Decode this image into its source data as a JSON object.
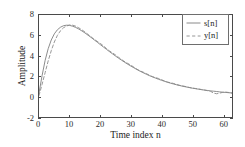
{
  "chart_data": {
    "type": "line",
    "title": "",
    "xlabel": "Time index n",
    "ylabel": "Amplitude",
    "xlim": [
      0,
      63
    ],
    "ylim": [
      -2,
      8
    ],
    "xticks": [
      0,
      10,
      20,
      30,
      40,
      50,
      60
    ],
    "yticks": [
      -2,
      0,
      2,
      4,
      6,
      8
    ],
    "xtick_labels": [
      "0",
      "10",
      "20",
      "30",
      "40",
      "50",
      "60"
    ],
    "ytick_labels": [
      "-2",
      "0",
      "2",
      "4",
      "6",
      "8"
    ],
    "grid": false,
    "legend_position": "upper right",
    "legend_entries": [
      "s[n]",
      "y[n]"
    ],
    "x": [
      0,
      1,
      2,
      3,
      4,
      5,
      6,
      7,
      8,
      9,
      10,
      11,
      12,
      13,
      14,
      15,
      16,
      17,
      18,
      19,
      20,
      21,
      22,
      23,
      24,
      25,
      26,
      27,
      28,
      29,
      30,
      31,
      32,
      33,
      34,
      35,
      36,
      37,
      38,
      39,
      40,
      41,
      42,
      43,
      44,
      45,
      46,
      47,
      48,
      49,
      50,
      51,
      52,
      53,
      54,
      55,
      56,
      57,
      58,
      59,
      60,
      61,
      62,
      63
    ],
    "series": [
      {
        "name": "s[n]",
        "style": "solid",
        "color": "#7d7d7d",
        "values": [
          0.35,
          2.05,
          3.55,
          4.7,
          5.55,
          6.15,
          6.55,
          6.8,
          6.95,
          7.0,
          6.98,
          6.9,
          6.78,
          6.62,
          6.44,
          6.24,
          6.02,
          5.8,
          5.57,
          5.34,
          5.1,
          4.87,
          4.64,
          4.41,
          4.19,
          3.97,
          3.76,
          3.56,
          3.36,
          3.17,
          2.99,
          2.82,
          2.65,
          2.49,
          2.34,
          2.2,
          2.06,
          1.94,
          1.82,
          1.7,
          1.6,
          1.5,
          1.4,
          1.31,
          1.23,
          1.15,
          1.08,
          1.01,
          0.95,
          0.89,
          0.83,
          0.78,
          0.73,
          0.68,
          0.64,
          0.6,
          0.56,
          0.53,
          0.5,
          0.46,
          0.43,
          0.41,
          0.38,
          0.36
        ]
      },
      {
        "name": "y[n]",
        "style": "dashed",
        "color": "#8a8a8a",
        "values": [
          0.1,
          1.2,
          2.35,
          3.5,
          4.5,
          5.35,
          6.0,
          6.45,
          6.75,
          6.92,
          7.02,
          7.0,
          6.9,
          6.74,
          6.55,
          6.33,
          6.1,
          5.86,
          5.62,
          5.42,
          5.22,
          4.98,
          4.72,
          4.48,
          4.28,
          4.08,
          3.85,
          3.62,
          3.42,
          3.25,
          3.08,
          2.88,
          2.68,
          2.52,
          2.4,
          2.26,
          2.1,
          1.96,
          1.86,
          1.78,
          1.66,
          1.52,
          1.42,
          1.36,
          1.28,
          1.18,
          1.1,
          1.04,
          0.98,
          0.9,
          0.84,
          0.8,
          0.75,
          0.7,
          0.64,
          0.58,
          0.52,
          0.34,
          0.28,
          0.34,
          0.42,
          0.44,
          0.4,
          0.34
        ]
      }
    ]
  },
  "axes": {
    "xlabel": "Time index n",
    "ylabel": "Amplitude"
  }
}
